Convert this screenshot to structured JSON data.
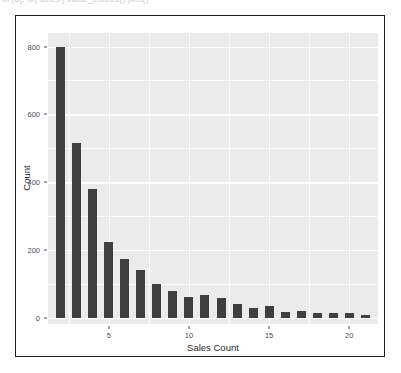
{
  "top_strip": {
    "ghost_text": "In [8]:   df['sales'].value_counts().plot()"
  },
  "figure": {
    "panel_color": "#ebebeb",
    "grid_color": "#ffffff",
    "bar_color": "#3f3f3f",
    "frame_color": "#1c1c1c"
  },
  "chart_data": {
    "type": "bar",
    "title": "",
    "xlabel": "Sales Count",
    "ylabel": "Count",
    "xlim": [
      1.2,
      21.8
    ],
    "ylim": [
      -18,
      840
    ],
    "grid": true,
    "legend": false,
    "yticks": [
      0,
      200,
      400,
      600,
      800
    ],
    "ytick_labels": [
      "0",
      "200",
      "400",
      "600",
      "800"
    ],
    "yminor": [
      100,
      300,
      500,
      700
    ],
    "xticks": [
      5,
      10,
      15,
      20
    ],
    "xtick_labels": [
      "5",
      "10",
      "15",
      "20"
    ],
    "xminor": [
      2.5,
      7.5,
      12.5,
      17.5
    ],
    "categories": [
      2,
      3,
      4,
      5,
      6,
      7,
      8,
      9,
      10,
      11,
      12,
      13,
      14,
      15,
      16,
      17,
      18,
      19,
      20,
      21
    ],
    "values": [
      800,
      515,
      380,
      225,
      175,
      140,
      100,
      78,
      62,
      68,
      60,
      42,
      30,
      35,
      18,
      20,
      13,
      14,
      15,
      10
    ]
  }
}
